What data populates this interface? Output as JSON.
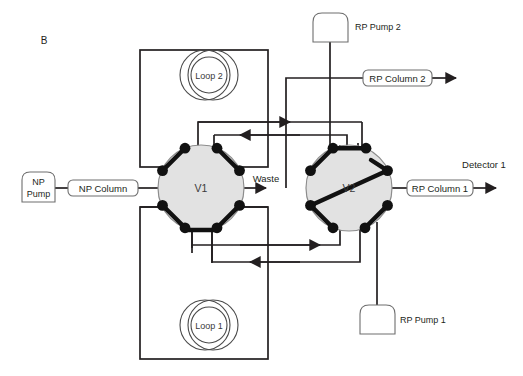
{
  "figure": {
    "panel_label": "B",
    "background_color": "#ffffff",
    "line_color": "#231f20",
    "valve_fill_color": "#e2e2e2",
    "valve_stroke_color": "#8d8d8d",
    "rotor_color": "#111111",
    "width": 523,
    "height": 376
  },
  "valves": [
    {
      "id": "v1",
      "label": "V1",
      "cx": 201,
      "cy": 188,
      "radius": 43,
      "port_count": 8
    },
    {
      "id": "v2",
      "label": "V2",
      "cx": 349,
      "cy": 188,
      "radius": 43,
      "port_count": 8
    }
  ],
  "loops": [
    {
      "id": "loop2",
      "label": "Loop 2",
      "cx": 209,
      "cy": 75
    },
    {
      "id": "loop1",
      "label": "Loop 1",
      "cx": 209,
      "cy": 325
    }
  ],
  "pumps": [
    {
      "id": "np_pump",
      "label_line1": "NP",
      "label_line2": "Pump",
      "inline": true
    },
    {
      "id": "rp_pump_2",
      "label": "RP Pump 2",
      "inline": false
    },
    {
      "id": "rp_pump_1",
      "label": "RP Pump 1",
      "inline": false
    }
  ],
  "columns": [
    {
      "id": "np_column",
      "label": "NP Column"
    },
    {
      "id": "rp_column_1",
      "label": "RP Column 1"
    },
    {
      "id": "rp_column_2",
      "label": "RP Column 2"
    }
  ],
  "outlets": [
    {
      "id": "waste",
      "label": "Waste"
    },
    {
      "id": "detector_1",
      "label": "Detector 1"
    }
  ]
}
